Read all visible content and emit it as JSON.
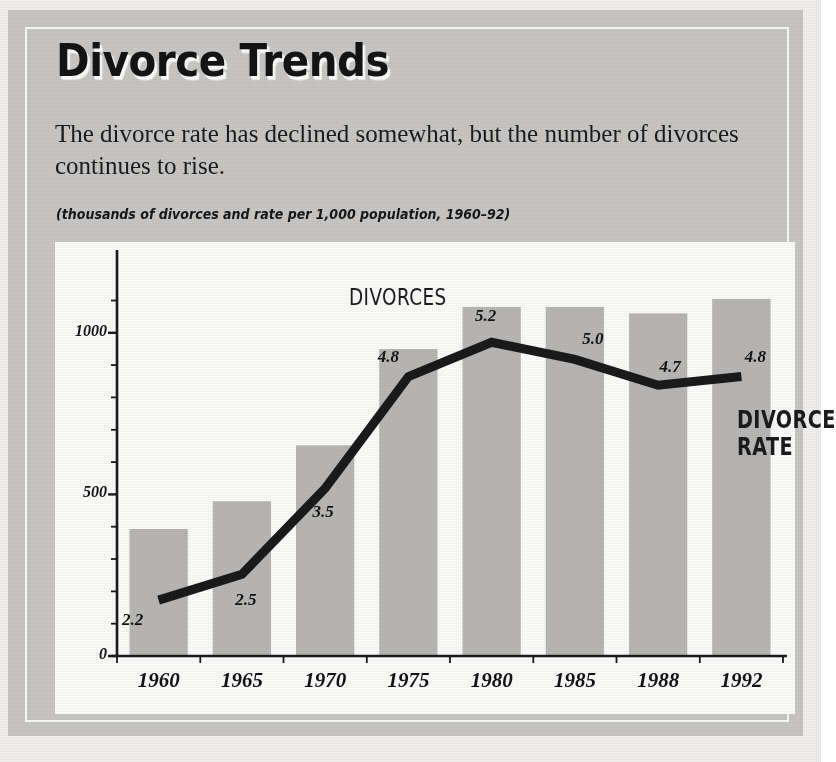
{
  "header": {
    "title": "Divorce Trends",
    "deck": "The divorce rate has declined somewhat, but the number of divorces continues to rise.",
    "caption": "(thousands of divorces and rate per 1,000 population, 1960–92)"
  },
  "colors": {
    "panel": "#c9c8c6",
    "plot_background": "#fdfdfc",
    "bar": "#b9b8b6",
    "line": "#1a1a1a",
    "axis": "#1a1a1a",
    "text": "#141414"
  },
  "chart_data": {
    "type": "bar",
    "title": "Divorce Trends",
    "subtitle": "The divorce rate has declined somewhat, but the number of divorces continues to rise.",
    "annotation": "(thousands of divorces and rate per 1,000 population, 1960–92)",
    "xlabel": "",
    "ylabel": "",
    "categories": [
      "1960",
      "1965",
      "1970",
      "1975",
      "1980",
      "1985",
      "1988",
      "1992"
    ],
    "ylim": [
      0,
      1250
    ],
    "yticks": [
      0,
      500,
      1000
    ],
    "ytick_labels": [
      "0",
      "500",
      "1000"
    ],
    "yminor_step": 100,
    "grid": false,
    "legend": "none",
    "series": [
      {
        "name": "DIVORCES",
        "type": "bar",
        "unit": "thousands of divorces",
        "values": [
          393,
          479,
          652,
          950,
          1080,
          1080,
          1060,
          1105
        ],
        "labels": [
          "",
          "",
          "",
          "",
          "",
          "",
          "",
          ""
        ],
        "axis": "left"
      },
      {
        "name": "DIVORCE RATE",
        "type": "line",
        "unit": "rate per 1,000 population",
        "values": [
          2.2,
          2.5,
          3.5,
          4.8,
          5.2,
          5.0,
          4.7,
          4.8
        ],
        "labels": [
          "2.2",
          "2.5",
          "3.5",
          "4.8",
          "5.2",
          "5.0",
          "4.7",
          "4.8"
        ],
        "axis": "right",
        "axis_hidden": true
      }
    ]
  }
}
